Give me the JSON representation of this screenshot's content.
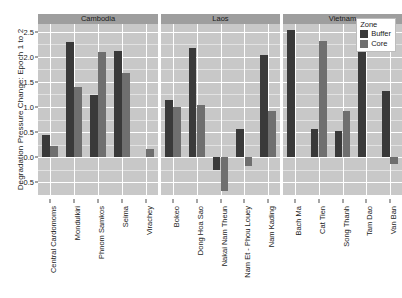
{
  "chart_data": {
    "type": "bar",
    "title": "",
    "subtitle": "",
    "xlabel": "",
    "ylabel": "Degradation Pressure Change: Epoch 1 to 2",
    "ylim": [
      -0.75,
      2.65
    ],
    "yticks": [
      2.5,
      2.0,
      1.5,
      1.0,
      0.5,
      0.0,
      -0.5
    ],
    "ytick_labels": [
      "2.5",
      "2.0",
      "1.5",
      "1.0",
      "0.5",
      "0.0",
      "-0.5"
    ],
    "grid": true,
    "legend_position": "top-right",
    "legend_title": "Zone",
    "series": [
      {
        "name": "Buffer",
        "color": "#3a3a3a"
      },
      {
        "name": "Core",
        "color": "#6f6f6f"
      }
    ],
    "facets": [
      {
        "label": "Cambodia",
        "categories": [
          "Central Cardomoms",
          "Mondulkiri",
          "Phnom Samkos",
          "Seima",
          "Virachey"
        ],
        "values": {
          "Buffer": [
            0.44,
            2.3,
            1.24,
            2.12,
            0.0
          ],
          "Core": [
            0.22,
            1.39,
            2.1,
            1.68,
            0.16
          ]
        }
      },
      {
        "label": "Laos",
        "categories": [
          "Bokeo",
          "Dong Hoa Sao",
          "Nakai Nam Theun",
          "Nam Et - Phou Louey",
          "Nam Kading"
        ],
        "values": {
          "Buffer": [
            1.14,
            2.17,
            -0.25,
            0.57,
            2.03
          ],
          "Core": [
            0.99,
            1.03,
            -0.67,
            -0.17,
            0.93
          ]
        }
      },
      {
        "label": "Vietnam",
        "categories": [
          "Bach Ma",
          "Cat Tien",
          "Song Thanh",
          "Tam Dao",
          "Van Ban"
        ],
        "values": {
          "Buffer": [
            2.53,
            0.56,
            0.52,
            2.32,
            1.31
          ],
          "Core": [
            0.0,
            2.32,
            0.93,
            0.0,
            -0.13
          ]
        }
      }
    ]
  },
  "legend": {
    "title": "Zone",
    "items": [
      {
        "label": "Buffer",
        "color": "#3a3a3a"
      },
      {
        "label": "Core",
        "color": "#6f6f6f"
      }
    ]
  },
  "axis": {
    "y_title": "Degradation Pressure Change: Epoch 1 to 2"
  }
}
